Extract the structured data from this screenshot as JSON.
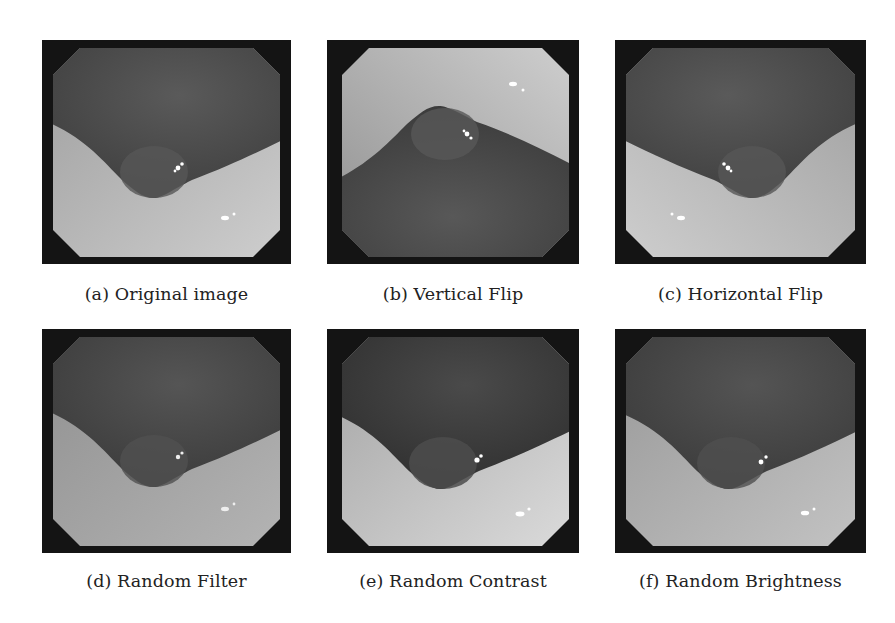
{
  "figure": {
    "panels": [
      {
        "id": "a",
        "label": "(a)",
        "caption": "(a) Original image",
        "transform": "original"
      },
      {
        "id": "b",
        "label": "(b)",
        "caption": "(b) Vertical Flip",
        "transform": "vertical-flip"
      },
      {
        "id": "c",
        "label": "(c)",
        "caption": "(c) Horizontal Flip",
        "transform": "horizontal-flip"
      },
      {
        "id": "d",
        "label": "(d)",
        "caption": "(d) Random Filter",
        "transform": "random-filter"
      },
      {
        "id": "e",
        "label": "(e)",
        "caption": "(e) Random Contrast",
        "transform": "random-contrast"
      },
      {
        "id": "f",
        "label": "(f)",
        "caption": "(f) Random Brightness",
        "transform": "random-brightness"
      }
    ],
    "colors": {
      "frame": "#141414",
      "mucosa_dark": "#4a4a4a",
      "mucosa_light": "#b9b9b9",
      "highlight": "#ffffff",
      "caption_text": "#222222"
    }
  }
}
